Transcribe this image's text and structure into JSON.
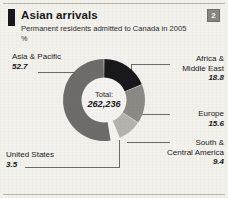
{
  "header": {
    "title": "Asian arrivals",
    "subtitle": "Permanent residents admitted to Canada in 2005",
    "units": "%",
    "badge": "2",
    "marker_icon": "black-tick-marker"
  },
  "center": {
    "total_label": "Total:",
    "total_value": "262,236"
  },
  "chart_data": {
    "type": "pie",
    "variant": "donut",
    "title": "Asian arrivals",
    "subtitle": "Permanent residents admitted to Canada in 2005",
    "units": "%",
    "total_label": "Total:",
    "total": "262,236",
    "start_angle_deg": 0,
    "direction": "clockwise",
    "categories": [
      "Africa & Middle East",
      "Europe",
      "South & Central America",
      "United States",
      "Asia & Pacific"
    ],
    "values": [
      18.8,
      15.6,
      9.4,
      3.5,
      52.7
    ],
    "colors": [
      "#19181a",
      "#8c8a85",
      "#b5b3ad",
      "#f4f3ef",
      "#6e6c68"
    ],
    "legend": "callout-labels",
    "grid": false,
    "slices": [
      {
        "name": "Africa & Middle East",
        "label_line1": "Africa &",
        "label_line2": "Middle East",
        "value": 18.8,
        "color": "#19181a"
      },
      {
        "name": "Europe",
        "label_line1": "Europe",
        "label_line2": "",
        "value": 15.6,
        "color": "#8c8a85"
      },
      {
        "name": "South & Central America",
        "label_line1": "South &",
        "label_line2": "Central America",
        "value": 9.4,
        "color": "#b5b3ad"
      },
      {
        "name": "United States",
        "label_line1": "United States",
        "label_line2": "",
        "value": 3.5,
        "color": "#f4f3ef"
      },
      {
        "name": "Asia & Pacific",
        "label_line1": "Asia & Pacific",
        "label_line2": "",
        "value": 52.7,
        "color": "#6e6c68"
      }
    ]
  },
  "labels": {
    "asia_name": "Asia & Pacific",
    "asia_value": "52.7",
    "us_name": "United States",
    "us_value": "3.5",
    "africa_name_1": "Africa &",
    "africa_name_2": "Middle East",
    "africa_value": "18.8",
    "europe_name": "Europe",
    "europe_value": "15.6",
    "south_name_1": "South &",
    "south_name_2": "Central America",
    "south_value": "9.4"
  }
}
